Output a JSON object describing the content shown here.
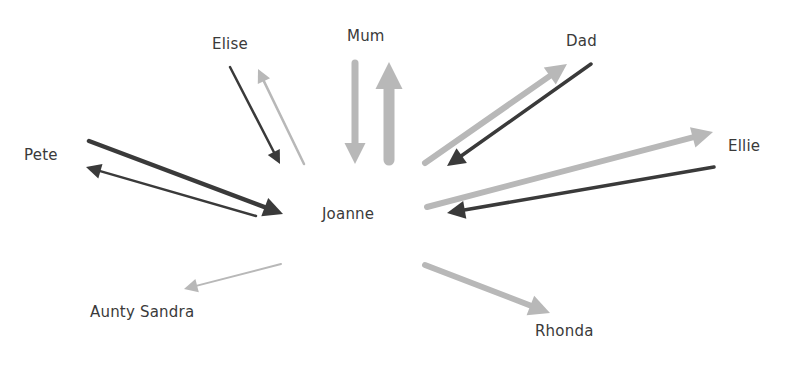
{
  "diagram": {
    "type": "relationship-flow",
    "center": {
      "id": "joanne",
      "label": "Joanne",
      "x": 322,
      "y": 205
    },
    "colors": {
      "dark": "#3a3a3a",
      "light": "#b8b8b8"
    },
    "nodes": [
      {
        "id": "mum",
        "label": "Mum",
        "x": 347,
        "y": 27
      },
      {
        "id": "elise",
        "label": "Elise",
        "x": 212,
        "y": 35
      },
      {
        "id": "dad",
        "label": "Dad",
        "x": 566,
        "y": 32
      },
      {
        "id": "pete",
        "label": "Pete",
        "x": 24,
        "y": 146
      },
      {
        "id": "ellie",
        "label": "Ellie",
        "x": 728,
        "y": 137
      },
      {
        "id": "aunty-sandra",
        "label": "Aunty Sandra",
        "x": 90,
        "y": 303
      },
      {
        "id": "rhonda",
        "label": "Rhonda",
        "x": 535,
        "y": 322
      }
    ],
    "arrows": [
      {
        "from": "mum",
        "to": "joanne",
        "shade": "light",
        "weight": 7,
        "x1": 355,
        "y1": 63,
        "x2": 355,
        "y2": 164,
        "head": 14
      },
      {
        "from": "joanne",
        "to": "mum",
        "shade": "light",
        "weight": 11,
        "x1": 389,
        "y1": 160,
        "x2": 389,
        "y2": 62,
        "head": 18
      },
      {
        "from": "elise",
        "to": "joanne",
        "shade": "dark",
        "weight": 2.5,
        "x1": 230,
        "y1": 67,
        "x2": 280,
        "y2": 164,
        "head": 9
      },
      {
        "from": "joanne",
        "to": "elise",
        "shade": "light",
        "weight": 2.5,
        "x1": 304,
        "y1": 164,
        "x2": 258,
        "y2": 69,
        "head": 9
      },
      {
        "from": "joanne",
        "to": "dad",
        "shade": "light",
        "weight": 6,
        "x1": 425,
        "y1": 163,
        "x2": 567,
        "y2": 64,
        "head": 14
      },
      {
        "from": "dad",
        "to": "joanne",
        "shade": "dark",
        "weight": 3.5,
        "x1": 591,
        "y1": 64,
        "x2": 447,
        "y2": 166,
        "head": 12
      },
      {
        "from": "pete",
        "to": "joanne",
        "shade": "dark",
        "weight": 4.5,
        "x1": 89,
        "y1": 141,
        "x2": 283,
        "y2": 214,
        "head": 13
      },
      {
        "from": "joanne",
        "to": "pete",
        "shade": "dark",
        "weight": 2.5,
        "x1": 256,
        "y1": 216,
        "x2": 86,
        "y2": 167,
        "head": 10
      },
      {
        "from": "joanne",
        "to": "ellie",
        "shade": "light",
        "weight": 6,
        "x1": 427,
        "y1": 207,
        "x2": 713,
        "y2": 132,
        "head": 14
      },
      {
        "from": "ellie",
        "to": "joanne",
        "shade": "dark",
        "weight": 3.5,
        "x1": 714,
        "y1": 167,
        "x2": 447,
        "y2": 213,
        "head": 12
      },
      {
        "from": "joanne",
        "to": "aunty-sandra",
        "shade": "light",
        "weight": 2,
        "x1": 281,
        "y1": 264,
        "x2": 184,
        "y2": 289,
        "head": 9
      },
      {
        "from": "joanne",
        "to": "rhonda",
        "shade": "light",
        "weight": 6,
        "x1": 425,
        "y1": 265,
        "x2": 550,
        "y2": 313,
        "head": 14
      }
    ]
  }
}
